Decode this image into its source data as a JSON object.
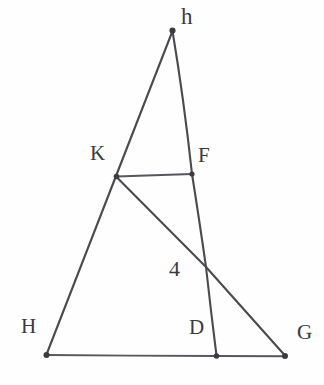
{
  "figure": {
    "kind": "geometry-diagram",
    "background_color": "#fefefe",
    "stroke_color": "#4a4a4f",
    "label_color": "#3a3a3e",
    "width": 324,
    "height": 385,
    "points": [
      {
        "id": "h",
        "label": "h",
        "x": 172,
        "y": 30,
        "label_x": 181,
        "label_y": 5,
        "dot": true
      },
      {
        "id": "K",
        "label": "K",
        "x": 116,
        "y": 176,
        "label_x": 90,
        "label_y": 143,
        "dot": true
      },
      {
        "id": "F",
        "label": "F",
        "x": 192,
        "y": 174,
        "label_x": 198,
        "label_y": 145,
        "dot": true
      },
      {
        "id": "X",
        "label": "4",
        "x": 206,
        "y": 267,
        "label_x": 169,
        "label_y": 258,
        "dot": false
      },
      {
        "id": "H",
        "label": "H",
        "x": 46,
        "y": 355,
        "label_x": 21,
        "label_y": 316,
        "dot": true
      },
      {
        "id": "D",
        "label": "D",
        "x": 216,
        "y": 356,
        "label_x": 189,
        "label_y": 317,
        "dot": true
      },
      {
        "id": "G",
        "label": "G",
        "x": 285,
        "y": 356,
        "label_x": 297,
        "label_y": 322,
        "dot": true
      }
    ],
    "segments": [
      {
        "id": "h-H",
        "from": "h",
        "to": "H",
        "through": [
          "K"
        ]
      },
      {
        "id": "h-D",
        "from": "h",
        "to": "D",
        "through": [
          "F",
          "X"
        ]
      },
      {
        "id": "K-F",
        "from": "K",
        "to": "F",
        "through": []
      },
      {
        "id": "K-G",
        "from": "K",
        "to": "G",
        "through": [
          "X"
        ]
      },
      {
        "id": "H-G",
        "from": "H",
        "to": "G",
        "through": [
          "D"
        ]
      }
    ]
  }
}
